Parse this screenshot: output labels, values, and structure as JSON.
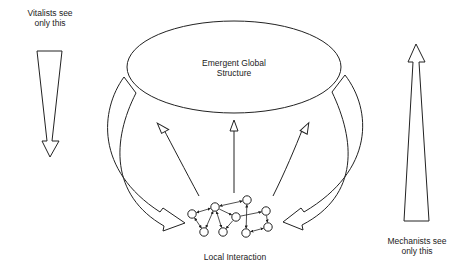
{
  "diagram": {
    "colors": {
      "stroke": "#222222",
      "background": "#ffffff",
      "text": "#222222"
    },
    "labels": {
      "vitalists": {
        "line1": "Vitalists see",
        "line2": "only this"
      },
      "mechanists": {
        "line1": "Mechanists see",
        "line2": "only this"
      },
      "global": {
        "line1": "Emergent Global",
        "line2": "Structure"
      },
      "local": "Local Interaction"
    },
    "nodes": [
      {
        "id": "A",
        "x": 192,
        "y": 214
      },
      {
        "id": "B",
        "x": 215,
        "y": 207
      },
      {
        "id": "C",
        "x": 247,
        "y": 200
      },
      {
        "id": "D",
        "x": 236,
        "y": 217
      },
      {
        "id": "E",
        "x": 204,
        "y": 232
      },
      {
        "id": "F",
        "x": 223,
        "y": 232
      },
      {
        "id": "G",
        "x": 266,
        "y": 211
      },
      {
        "id": "H",
        "x": 246,
        "y": 233
      },
      {
        "id": "I",
        "x": 268,
        "y": 227
      }
    ],
    "edges": [
      {
        "from": "A",
        "to": "B",
        "bidir": true
      },
      {
        "from": "B",
        "to": "C",
        "bidir": true
      },
      {
        "from": "B",
        "to": "D",
        "bidir": false
      },
      {
        "from": "B",
        "to": "E",
        "bidir": true
      },
      {
        "from": "B",
        "to": "F",
        "bidir": true
      },
      {
        "from": "D",
        "to": "F",
        "bidir": false
      },
      {
        "from": "C",
        "to": "H",
        "bidir": true
      },
      {
        "from": "D",
        "to": "G",
        "bidir": false
      },
      {
        "from": "G",
        "to": "I",
        "bidir": false
      },
      {
        "from": "H",
        "to": "I",
        "bidir": true
      },
      {
        "from": "A",
        "to": "E",
        "bidir": true
      }
    ]
  }
}
